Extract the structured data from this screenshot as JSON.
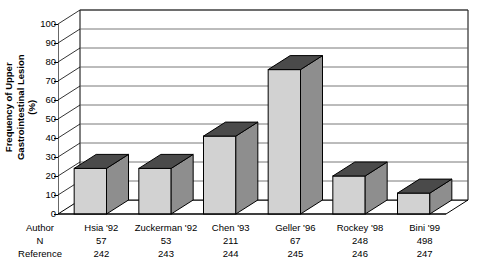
{
  "chart_data": {
    "type": "bar",
    "title": "",
    "xlabel": "",
    "ylabel": "Frequency of Upper Gastrointestinal Lesion (%)",
    "ylim": [
      0,
      100
    ],
    "ytick_values": [
      0,
      10,
      20,
      30,
      40,
      50,
      60,
      70,
      80,
      90,
      100
    ],
    "grid": true,
    "legend": "none",
    "style": "3d-column",
    "categories": [
      "Hsia '92",
      "Zuckerman '92",
      "Chen '93",
      "Geller '96",
      "Rockey '98",
      "Bini '99"
    ],
    "values": [
      24,
      24,
      41,
      76,
      20,
      11
    ],
    "series": [
      {
        "name": "Frequency of Upper Gastrointestinal Lesion (%)",
        "values": [
          24,
          24,
          41,
          76,
          20,
          11
        ]
      }
    ],
    "table_row_headers": [
      "Author",
      "N",
      "Reference"
    ],
    "rows": {
      "author": [
        "Hsia '92",
        "Zuckerman '92",
        "Chen '93",
        "Geller '96",
        "Rockey '98",
        "Bini '99"
      ],
      "n": [
        "57",
        "53",
        "211",
        "67",
        "248",
        "498"
      ],
      "reference": [
        "242",
        "243",
        "244",
        "245",
        "246",
        "247"
      ]
    },
    "colors": {
      "bar_front": "#d2d2d2",
      "bar_top": "#4a4a4a",
      "bar_side": "#8e8e8e",
      "axis": "#000000",
      "grid": "#555555",
      "background": "#ffffff"
    }
  },
  "ylabel_lines": {
    "line1": "Frequency of Upper",
    "line2": "Gastrointestinal Lesion",
    "line3": "(%)"
  }
}
